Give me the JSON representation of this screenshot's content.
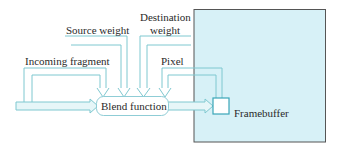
{
  "diagram": {
    "labels": {
      "source_weight": "Source weight",
      "destination_weight_line1": "Destination",
      "destination_weight_line2": "weight",
      "incoming_fragment": "Incoming fragment",
      "pixel": "Pixel",
      "blend_function": "Blend function",
      "framebuffer": "Framebuffer"
    },
    "colors": {
      "arrow_stroke": "#7fc8d0",
      "arrow_fill": "#e6f6f8",
      "framebuffer_fill": "#d7f1f7",
      "framebuffer_border": "#555555",
      "pixel_border": "#3aa6b8",
      "blend_border": "#8fcdd6"
    }
  }
}
